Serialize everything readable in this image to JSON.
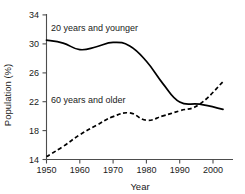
{
  "chart_data": {
    "type": "line",
    "title": "",
    "xlabel": "Year",
    "ylabel": "Population (%)",
    "xlim": [
      1950,
      2006
    ],
    "ylim": [
      14,
      34
    ],
    "xticks": [
      1950,
      1960,
      1970,
      1980,
      1990,
      2000
    ],
    "yticks": [
      14,
      18,
      22,
      26,
      30,
      34
    ],
    "xtick_labels": [
      "1950",
      "1960",
      "1970",
      "1980",
      "1990",
      "2000"
    ],
    "ytick_labels": [
      "14",
      "18",
      "22",
      "26",
      "30",
      "34"
    ],
    "grid": false,
    "legend_position": "inline-annotation",
    "series": [
      {
        "name": "20 years and younger",
        "style": "solid",
        "color": "#000000",
        "annotation": "20 years and younger",
        "x": [
          1950,
          1955,
          1960,
          1965,
          1970,
          1975,
          1980,
          1985,
          1990,
          1996,
          2003
        ],
        "values": [
          30.4,
          30.0,
          29.1,
          29.5,
          30.1,
          29.6,
          27.5,
          24.4,
          21.9,
          21.6,
          20.9
        ]
      },
      {
        "name": "60 years and older",
        "style": "dashed",
        "color": "#000000",
        "annotation": "60 years and older",
        "x": [
          1950,
          1955,
          1960,
          1965,
          1970,
          1975,
          1980,
          1985,
          1990,
          1996,
          2003
        ],
        "values": [
          14.4,
          15.8,
          17.4,
          18.7,
          19.9,
          20.4,
          19.4,
          20.0,
          20.7,
          21.6,
          24.7
        ]
      }
    ]
  },
  "annotations": {
    "upper_label": "20 years and younger",
    "lower_label": "60 years and older"
  },
  "axes": {
    "x_title": "Year",
    "y_title": "Population (%)"
  }
}
